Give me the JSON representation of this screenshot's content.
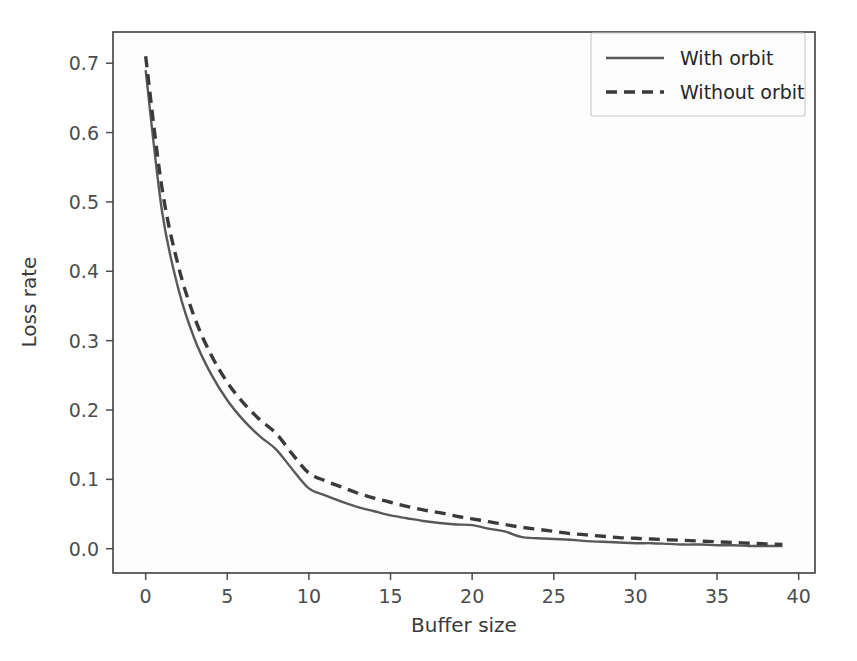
{
  "chart_data": {
    "type": "line",
    "title": "",
    "xlabel": "Buffer size",
    "ylabel": "Loss rate",
    "xlim": [
      -2.0,
      41.0
    ],
    "ylim": [
      -0.035,
      0.745
    ],
    "xticks": [
      0,
      5,
      10,
      15,
      20,
      25,
      30,
      35,
      40
    ],
    "xticklabels": [
      "0",
      "5",
      "10",
      "15",
      "20",
      "25",
      "30",
      "35",
      "40"
    ],
    "yticks": [
      0.0,
      0.1,
      0.2,
      0.3,
      0.4,
      0.5,
      0.6,
      0.7
    ],
    "yticklabels": [
      "0.0",
      "0.1",
      "0.2",
      "0.3",
      "0.4",
      "0.5",
      "0.6",
      "0.7"
    ],
    "grid": false,
    "legend_position": "upper right",
    "x": [
      0,
      1,
      2,
      3,
      4,
      5,
      6,
      7,
      8,
      9,
      10,
      11,
      12,
      13,
      14,
      15,
      16,
      17,
      18,
      19,
      20,
      21,
      22,
      23,
      24,
      25,
      26,
      27,
      28,
      29,
      30,
      31,
      32,
      33,
      34,
      35,
      36,
      37,
      38,
      39
    ],
    "series": [
      {
        "name": "With orbit",
        "style": "solid",
        "color": "#595959",
        "values": [
          0.69,
          0.487,
          0.375,
          0.302,
          0.252,
          0.214,
          0.185,
          0.162,
          0.143,
          0.114,
          0.087,
          0.077,
          0.068,
          0.06,
          0.054,
          0.048,
          0.044,
          0.04,
          0.037,
          0.035,
          0.034,
          0.029,
          0.025,
          0.017,
          0.015,
          0.014,
          0.013,
          0.011,
          0.01,
          0.009,
          0.008,
          0.008,
          0.007,
          0.006,
          0.006,
          0.005,
          0.005,
          0.004,
          0.004,
          0.004
        ]
      },
      {
        "name": "Without orbit",
        "style": "dashed",
        "color": "#3a3a3a",
        "values": [
          0.71,
          0.52,
          0.408,
          0.333,
          0.28,
          0.24,
          0.21,
          0.186,
          0.166,
          0.136,
          0.109,
          0.098,
          0.089,
          0.08,
          0.073,
          0.067,
          0.061,
          0.056,
          0.052,
          0.047,
          0.043,
          0.039,
          0.035,
          0.031,
          0.028,
          0.025,
          0.022,
          0.02,
          0.018,
          0.016,
          0.015,
          0.014,
          0.013,
          0.012,
          0.011,
          0.01,
          0.009,
          0.008,
          0.007,
          0.006
        ]
      }
    ],
    "legend": [
      {
        "label": "With orbit",
        "style": "solid"
      },
      {
        "label": "Without orbit",
        "style": "dashed"
      }
    ]
  },
  "axes": {
    "x_title": "Buffer size",
    "y_title": "Loss rate"
  },
  "colors": {
    "background": "#ffffff",
    "plot_background": "#fdfdfd",
    "spine": "#3f3f3f",
    "tick_text": "#4d4d4d",
    "series_solid": "#595959",
    "series_dashed": "#3a3a3a"
  }
}
